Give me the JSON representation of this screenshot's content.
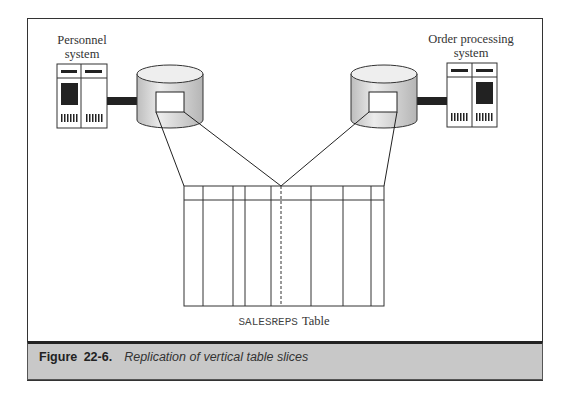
{
  "figure": {
    "label": "Figure 22-6.",
    "caption": "Replication of vertical table slices"
  },
  "left_system": {
    "label_line1": "Personnel",
    "label_line2": "system",
    "icon": "server-icon"
  },
  "right_system": {
    "label_line1": "Order processing",
    "label_line2": "system",
    "icon": "server-icon"
  },
  "databases": [
    {
      "name": "personnel-database",
      "icon": "database-cylinder-icon"
    },
    {
      "name": "order-processing-database",
      "icon": "database-cylinder-icon"
    }
  ],
  "table": {
    "name_mono": "SALESREPS",
    "name_suffix": "Table",
    "column_boundaries_x": [
      184,
      203,
      233,
      245,
      271,
      281,
      311,
      343,
      371,
      384
    ],
    "split_column_x": 281,
    "split_style": "dashed"
  },
  "colors": {
    "frame": "#333333",
    "cylinder_fill": "#d9d9d9",
    "cylinder_top": "#eeeeee",
    "caption_bg": "#c8c8c8",
    "connector": "#222222"
  }
}
